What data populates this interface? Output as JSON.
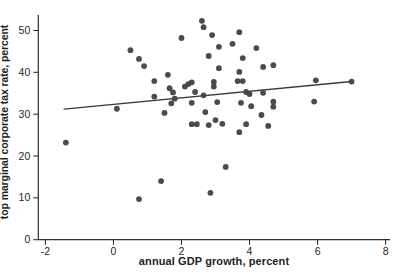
{
  "chart_data": {
    "type": "scatter",
    "title": "",
    "xlabel": "annual GDP growth, percent",
    "ylabel": "top marginal corporate tax rate, percent",
    "x_ticks": [
      -2,
      0,
      2,
      4,
      6,
      8
    ],
    "y_ticks": [
      0,
      10,
      20,
      30,
      40,
      50
    ],
    "xlim": [
      -2.21,
      8.13
    ],
    "ylim": [
      0,
      53.7
    ],
    "grid": false,
    "legend": "none",
    "points": [
      [
        -1.4,
        23.2
      ],
      [
        0.1,
        31.3
      ],
      [
        0.5,
        45.3
      ],
      [
        0.75,
        43.2
      ],
      [
        0.75,
        9.7
      ],
      [
        0.9,
        41.5
      ],
      [
        1.2,
        37.9
      ],
      [
        1.2,
        34.2
      ],
      [
        1.4,
        14.0
      ],
      [
        1.5,
        30.3
      ],
      [
        1.6,
        39.4
      ],
      [
        1.65,
        36.2
      ],
      [
        1.7,
        32.6
      ],
      [
        1.75,
        35.2
      ],
      [
        1.8,
        33.7
      ],
      [
        2.0,
        48.2
      ],
      [
        2.1,
        36.6
      ],
      [
        2.2,
        37.2
      ],
      [
        2.3,
        37.6
      ],
      [
        2.3,
        32.7
      ],
      [
        2.3,
        27.6
      ],
      [
        2.4,
        35.3
      ],
      [
        2.45,
        27.6
      ],
      [
        2.6,
        52.3
      ],
      [
        2.65,
        50.8
      ],
      [
        2.65,
        34.5
      ],
      [
        2.7,
        30.5
      ],
      [
        2.8,
        43.9
      ],
      [
        2.8,
        27.4
      ],
      [
        2.85,
        11.2
      ],
      [
        2.9,
        48.9
      ],
      [
        2.95,
        37.7
      ],
      [
        2.95,
        36.6
      ],
      [
        3.0,
        28.6
      ],
      [
        3.05,
        32.9
      ],
      [
        3.1,
        46.1
      ],
      [
        3.1,
        41.0
      ],
      [
        3.2,
        27.7
      ],
      [
        3.3,
        17.4
      ],
      [
        3.5,
        46.8
      ],
      [
        3.65,
        37.9
      ],
      [
        3.7,
        49.6
      ],
      [
        3.7,
        40.1
      ],
      [
        3.7,
        25.7
      ],
      [
        3.75,
        32.7
      ],
      [
        3.8,
        43.4
      ],
      [
        3.8,
        37.9
      ],
      [
        3.9,
        35.3
      ],
      [
        3.9,
        27.6
      ],
      [
        4.0,
        34.8
      ],
      [
        4.05,
        31.9
      ],
      [
        4.2,
        45.8
      ],
      [
        4.35,
        29.8
      ],
      [
        4.4,
        41.3
      ],
      [
        4.4,
        35.1
      ],
      [
        4.55,
        27.2
      ],
      [
        4.7,
        41.7
      ],
      [
        4.7,
        33.0
      ],
      [
        4.7,
        31.8
      ],
      [
        5.9,
        33.0
      ],
      [
        5.95,
        38.1
      ],
      [
        7.0,
        37.8
      ]
    ],
    "trendline": {
      "x1": -1.45,
      "y1": 31.2,
      "x2": 7.0,
      "y2": 37.8
    },
    "colors": {
      "dot": "#414043",
      "trend": "#3a3a3c",
      "axis": "#2e2e30",
      "text": "#1f1f21",
      "background": "#ffffff"
    }
  }
}
